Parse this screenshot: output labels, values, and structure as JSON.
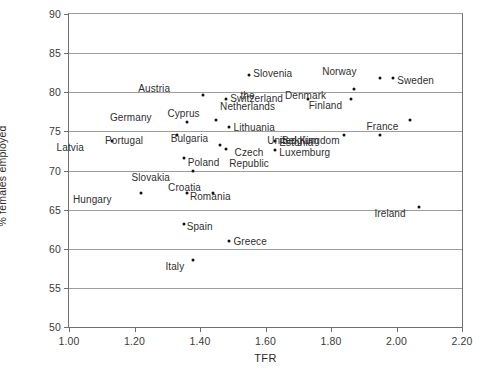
{
  "chart_data": {
    "type": "scatter",
    "title": "",
    "xlabel": "TFR",
    "ylabel": "% females employed",
    "xlim": [
      1.0,
      2.2
    ],
    "ylim": [
      50,
      90
    ],
    "xticks": [
      "1.00",
      "1.20",
      "1.40",
      "1.60",
      "1.80",
      "2.00",
      "2.20"
    ],
    "xtick_values": [
      1.0,
      1.2,
      1.4,
      1.6,
      1.8,
      2.0,
      2.2
    ],
    "yticks": [
      "50",
      "55",
      "60",
      "65",
      "70",
      "75",
      "80",
      "85",
      "90"
    ],
    "ytick_values": [
      50,
      55,
      60,
      65,
      70,
      75,
      80,
      85,
      90
    ],
    "grid": "horizontal",
    "legend": "none",
    "points": [
      {
        "label": "Latvia",
        "x": 1.13,
        "y": 73.8,
        "lx": -28,
        "ly": 6
      },
      {
        "label": "Hungary",
        "x": 1.22,
        "y": 67.1,
        "lx": -29,
        "ly": 6
      },
      {
        "label": "Portugal",
        "x": 1.33,
        "y": 74.6,
        "lx": -34,
        "ly": 5
      },
      {
        "label": "Spain",
        "x": 1.35,
        "y": 63.1,
        "lx": 3,
        "ly": 2
      },
      {
        "label": "Slovakia",
        "x": 1.38,
        "y": 69.9,
        "lx": -23,
        "ly": 6
      },
      {
        "label": "Poland",
        "x": 1.35,
        "y": 71.6,
        "lx": 4,
        "ly": 4
      },
      {
        "label": "Germany",
        "x": 1.36,
        "y": 76.2,
        "lx": -35,
        "ly": -5
      },
      {
        "label": "Italy",
        "x": 1.38,
        "y": 58.5,
        "lx": -9,
        "ly": 6
      },
      {
        "label": "Romania",
        "x": 1.36,
        "y": 67.1,
        "lx": 3,
        "ly": 3
      },
      {
        "label": "Austria",
        "x": 1.41,
        "y": 79.6,
        "lx": -33,
        "ly": -7
      },
      {
        "label": "Cyprus",
        "x": 1.45,
        "y": 76.5,
        "lx": -17,
        "ly": -7
      },
      {
        "label": "Croatia",
        "x": 1.44,
        "y": 67.1,
        "lx": -12,
        "ly": -6
      },
      {
        "label": "Bulgaria",
        "x": 1.46,
        "y": 73.3,
        "lx": -11,
        "ly": -7
      },
      {
        "label": "Greece",
        "x": 1.49,
        "y": 61.0,
        "lx": 4,
        "ly": 0
      },
      {
        "label": "Czech\nRepublic",
        "x": 1.48,
        "y": 72.8,
        "lx": 3,
        "ly": 3,
        "two_line": true
      },
      {
        "label": "Switzerland",
        "x": 1.48,
        "y": 79.1,
        "lx": 4,
        "ly": -1
      },
      {
        "label": "Lithuania",
        "x": 1.49,
        "y": 75.5,
        "lx": 4,
        "ly": 0
      },
      {
        "label": "Slovenia",
        "x": 1.55,
        "y": 82.2,
        "lx": 4,
        "ly": -2
      },
      {
        "label": "Estonia",
        "x": 1.63,
        "y": 73.8,
        "lx": 4,
        "ly": 1
      },
      {
        "label": "Luxemburg",
        "x": 1.63,
        "y": 72.6,
        "lx": 4,
        "ly": 2
      },
      {
        "label": "the\nNetherlands",
        "x": 1.73,
        "y": 79.2,
        "lx": -33,
        "ly": -4,
        "two_line": true
      },
      {
        "label": "Finland",
        "x": 1.86,
        "y": 79.2,
        "lx": -8,
        "ly": 6
      },
      {
        "label": "Denmark",
        "x": 1.87,
        "y": 80.4,
        "lx": -28,
        "ly": 6
      },
      {
        "label": "Belgium",
        "x": 1.84,
        "y": 74.6,
        "lx": -25,
        "ly": 5
      },
      {
        "label": "United Kingdom",
        "x": 1.95,
        "y": 74.6,
        "lx": -40,
        "ly": 5
      },
      {
        "label": "Norway",
        "x": 1.95,
        "y": 81.8,
        "lx": -23,
        "ly": -7
      },
      {
        "label": "Sweden",
        "x": 1.99,
        "y": 81.8,
        "lx": 4,
        "ly": 2
      },
      {
        "label": "France",
        "x": 2.04,
        "y": 76.4,
        "lx": -11,
        "ly": 6
      },
      {
        "label": "Ireland",
        "x": 2.07,
        "y": 65.3,
        "lx": -14,
        "ly": 6
      }
    ]
  }
}
